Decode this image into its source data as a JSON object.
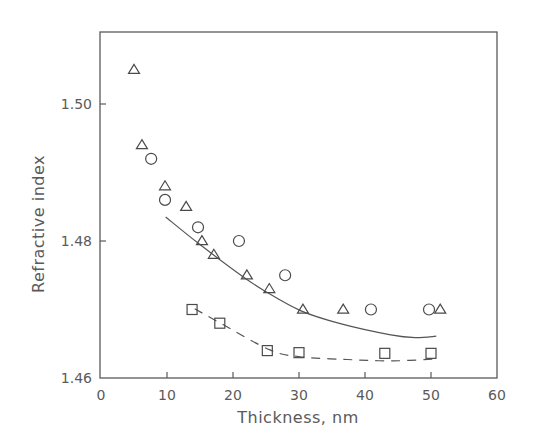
{
  "chart_data": {
    "type": "scatter",
    "title": "",
    "xlabel": "Thickness, nm",
    "ylabel": "Refractive index",
    "xlim": [
      0,
      60
    ],
    "ylim": [
      1.46,
      1.511
    ],
    "xticks": [
      0,
      10,
      20,
      30,
      40,
      50,
      60
    ],
    "xtick_labels": [
      "0",
      "10",
      "20",
      "30",
      "40",
      "50",
      "60"
    ],
    "yticks": [
      1.46,
      1.48,
      1.5
    ],
    "ytick_labels": [
      "1.46",
      "1.48",
      "1.50"
    ],
    "grid": false,
    "legend": null,
    "series": [
      {
        "name": "triangles",
        "marker": "triangle",
        "x": [
          5.0,
          6.2,
          9.7,
          12.9,
          15.3,
          17.1,
          22.1,
          25.5,
          30.6,
          36.7,
          51.4
        ],
        "y": [
          1.505,
          1.494,
          1.488,
          1.485,
          1.48,
          1.478,
          1.475,
          1.473,
          1.47,
          1.47,
          1.47
        ]
      },
      {
        "name": "circles",
        "marker": "circle",
        "x": [
          7.6,
          9.7,
          14.7,
          20.9,
          27.9,
          40.9,
          49.7
        ],
        "y": [
          1.492,
          1.486,
          1.482,
          1.48,
          1.475,
          1.47,
          1.47
        ]
      },
      {
        "name": "squares",
        "marker": "square",
        "x": [
          13.8,
          18.0,
          25.2,
          30.0,
          43.0,
          50.0
        ],
        "y": [
          1.47,
          1.468,
          1.464,
          1.4637,
          1.4636,
          1.4636
        ]
      }
    ],
    "curves": [
      {
        "name": "solid-fit",
        "style": "solid",
        "x": [
          9.8,
          14.7,
          21.2,
          24.8,
          30.3,
          36.4,
          43.9,
          47.6,
          50.8
        ],
        "y": [
          1.4835,
          1.4797,
          1.475,
          1.4727,
          1.4698,
          1.4679,
          1.4663,
          1.4659,
          1.4661
        ]
      },
      {
        "name": "dashed-fit",
        "style": "dashed",
        "x": [
          14.2,
          18.3,
          25.6,
          30.2,
          37.3,
          44.2,
          51.1
        ],
        "y": [
          1.4701,
          1.4679,
          1.4641,
          1.4631,
          1.4627,
          1.4625,
          1.4628
        ]
      }
    ]
  },
  "colors": {
    "axis": "#5a5a5a",
    "marker": "#4a4a4a",
    "line": "#555555",
    "background": "#ffffff"
  }
}
